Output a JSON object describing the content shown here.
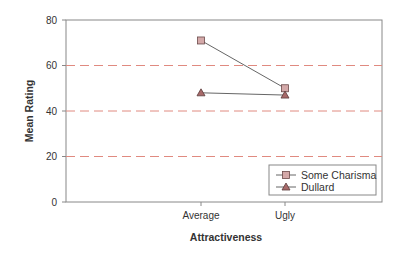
{
  "chart_data": {
    "type": "line",
    "title": "",
    "xlabel": "Attractiveness",
    "ylabel": "Mean Rating",
    "categories": [
      "Average",
      "Ugly"
    ],
    "ylim": [
      0,
      80
    ],
    "yticks": [
      0,
      20,
      40,
      60,
      80
    ],
    "grid": {
      "on": true,
      "style": "dashed",
      "axis": "y",
      "lines": [
        20,
        40,
        60
      ],
      "color": "#e08a80"
    },
    "legend_position": "lower right",
    "series": [
      {
        "name": "Some Charisma",
        "marker": "square",
        "values": [
          71,
          50
        ],
        "marker_color": "#d4a9a9",
        "line_color": "#666666"
      },
      {
        "name": "Dullard",
        "marker": "triangle",
        "values": [
          48,
          47
        ],
        "marker_color": "#a86a6a",
        "line_color": "#666666"
      }
    ]
  },
  "legend": {
    "items": [
      "Some Charisma",
      "Dullard"
    ]
  },
  "axes": {
    "x_title": "Attractiveness",
    "y_title": "Mean Rating",
    "y_tick_labels": [
      "0",
      "20",
      "40",
      "60",
      "80"
    ],
    "x_tick_labels": [
      "Average",
      "Ugly"
    ]
  }
}
